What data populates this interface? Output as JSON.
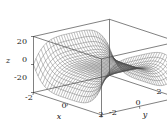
{
  "figure": {
    "background_color": "#ffffff",
    "line_color": "#2b2b2b",
    "mesh_color": "#4a4a4a",
    "width": 167,
    "height": 124
  },
  "axes": {
    "x": {
      "label": "x",
      "ticks": [
        "-2",
        "0",
        "2"
      ],
      "range": [
        -2,
        2
      ]
    },
    "y": {
      "label": "y",
      "ticks": [
        "-2",
        "0",
        "2"
      ],
      "range": [
        -2,
        2
      ]
    },
    "z": {
      "label": "z",
      "ticks": [
        "20",
        "0",
        "-20"
      ],
      "range": [
        -20,
        20
      ]
    }
  },
  "chart_data": {
    "type": "surface",
    "title": "",
    "xlabel": "x",
    "ylabel": "y",
    "zlabel": "z",
    "xlim": [
      -2,
      2
    ],
    "ylim": [
      -2,
      2
    ],
    "zlim": [
      -20,
      20
    ],
    "xticks": [
      -2,
      0,
      2
    ],
    "yticks": [
      -2,
      0,
      2
    ],
    "zticks": [
      -20,
      0,
      20
    ],
    "grid": false,
    "legend": "none",
    "surface_description": "hyperbolic paraboloid saddle wireframe mesh",
    "expression": "z = x^4 - y^4",
    "mesh_lines_u": 30,
    "mesh_lines_v": 30,
    "samples": {
      "corners": [
        {
          "x": -2,
          "y": -2,
          "z": 0
        },
        {
          "x": 2,
          "y": -2,
          "z": 0
        },
        {
          "x": 2,
          "y": 2,
          "z": 0
        },
        {
          "x": -2,
          "y": 2,
          "z": 0
        }
      ],
      "edge_midpoints": [
        {
          "x": 0,
          "y": -2,
          "z": -16
        },
        {
          "x": 0,
          "y": 2,
          "z": -16
        },
        {
          "x": -2,
          "y": 0,
          "z": 16
        },
        {
          "x": 2,
          "y": 0,
          "z": 16
        }
      ],
      "center": {
        "x": 0,
        "y": 0,
        "z": 0
      }
    }
  }
}
